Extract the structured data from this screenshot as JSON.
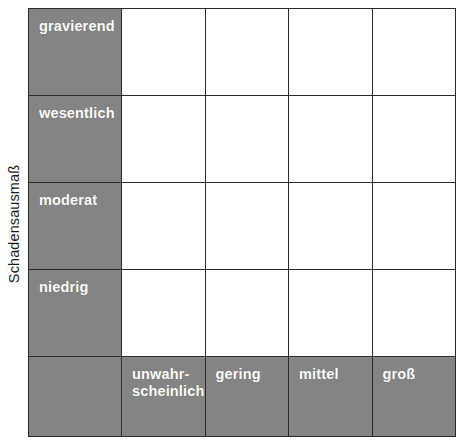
{
  "chart_data": {
    "type": "table",
    "ylabel": "Schadensausmaß",
    "xlabel": "",
    "grid": true,
    "legend": "none",
    "row_categories": [
      "gravierend",
      "wesentlich",
      "moderat",
      "niedrig"
    ],
    "column_categories": [
      "unwahr-scheinlich",
      "gering",
      "mittel",
      "groß"
    ],
    "cells": [
      [
        "",
        "",
        "",
        ""
      ],
      [
        "",
        "",
        "",
        ""
      ],
      [
        "",
        "",
        "",
        ""
      ],
      [
        "",
        "",
        "",
        ""
      ]
    ],
    "colors": {
      "header_fill": "#828282",
      "cell_fill": "#ffffff",
      "grid_line": "#2a2a2a",
      "header_text": "#ffffff",
      "axis_text": "#1a1a1a"
    }
  },
  "axis": {
    "y_label": "Schadensausmaß"
  },
  "rows": [
    {
      "label": "gravierend"
    },
    {
      "label": "wesentlich"
    },
    {
      "label": "moderat"
    },
    {
      "label": "niedrig"
    }
  ],
  "columns": [
    {
      "label_line1": "unwahr-",
      "label_line2": "scheinlich"
    },
    {
      "label_line1": "gering",
      "label_line2": ""
    },
    {
      "label_line1": "mittel",
      "label_line2": ""
    },
    {
      "label_line1": "groß",
      "label_line2": ""
    }
  ]
}
